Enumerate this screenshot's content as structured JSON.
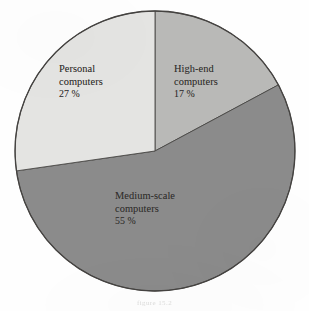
{
  "figure": {
    "background_color": "#fefefe",
    "caption_artifact": "figure 15.2"
  },
  "chart_data": {
    "type": "pie",
    "title": "",
    "subtitle": "",
    "xlabel": "",
    "ylabel": "",
    "grid": false,
    "legend_position": "none",
    "labels_inside_slices": true,
    "unit": "%",
    "center_x": 155,
    "center_y": 151,
    "radius": 140,
    "start_angle_deg": 0,
    "direction": "clockwise",
    "categories": [
      "High-end computers",
      "Medium-scale computers",
      "Personal computers"
    ],
    "values": [
      17,
      55,
      27
    ],
    "colors": [
      "#b9b9b7",
      "#8b8b8b",
      "#e4e4e2"
    ],
    "outline_color": "#4a4846",
    "slices": [
      {
        "name": "High-end computers",
        "label_line1": "High-end",
        "label_line2": "computers",
        "value": 17,
        "value_text": "17 %",
        "color": "#b9b9b7",
        "start_deg": 0,
        "end_deg": 61.2
      },
      {
        "name": "Medium-scale computers",
        "label_line1": "Medium-scale",
        "label_line2": "computers",
        "value": 55,
        "value_text": "55 %",
        "color": "#8b8b8b",
        "start_deg": 61.2,
        "end_deg": 259.2
      },
      {
        "name": "Personal computers",
        "label_line1": "Personal",
        "label_line2": "computers",
        "value": 27,
        "value_text": "27 %",
        "color": "#e4e4e2",
        "start_deg": 259.2,
        "end_deg": 360
      }
    ]
  }
}
